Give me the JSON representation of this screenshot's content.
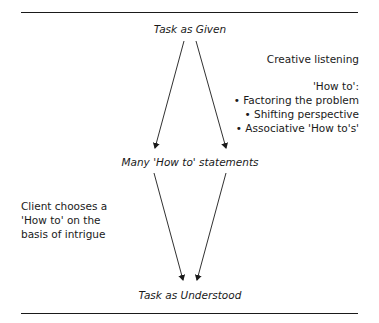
{
  "diagram": {
    "nodes": {
      "top": "Task as Given",
      "middle": "Many 'How to' statements",
      "bottom": "Task as Understood"
    },
    "annotations": {
      "creative_listening": "Creative listening",
      "how_to_heading": "'How to':",
      "how_to_items": [
        "• Factoring the problem",
        "• Shifting perspective",
        "• Associative 'How to's'"
      ],
      "client_choice": [
        "Client chooses a",
        "'How to' on the",
        "basis of intrigue"
      ]
    },
    "edges": [
      {
        "from": "Task as Given",
        "to": "Many 'How to' statements",
        "side": "left"
      },
      {
        "from": "Task as Given",
        "to": "Many 'How to' statements",
        "side": "right"
      },
      {
        "from": "Many 'How to' statements",
        "to": "Task as Understood",
        "side": "left"
      },
      {
        "from": "Many 'How to' statements",
        "to": "Task as Understood",
        "side": "right"
      }
    ],
    "colors": {
      "line": "#1a1a1a",
      "text": "#1a1a1a",
      "background": "#ffffff"
    }
  }
}
